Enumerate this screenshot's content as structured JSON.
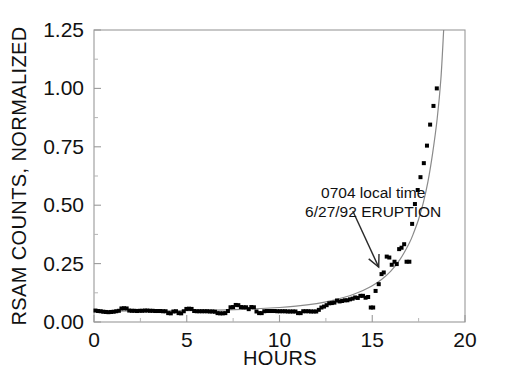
{
  "chart_data": {
    "type": "scatter",
    "title": "",
    "subtitle": "",
    "xlabel": "HOURS",
    "ylabel": "RSAM COUNTS, NORMALIZED",
    "xlim": [
      0,
      20
    ],
    "ylim": [
      0.0,
      1.25
    ],
    "xticks": [
      0,
      5,
      10,
      15,
      20
    ],
    "xtick_labels": [
      "0",
      "5",
      "10",
      "15",
      "20"
    ],
    "yticks": [
      0.0,
      0.25,
      0.5,
      0.75,
      1.0,
      1.25
    ],
    "ytick_labels": [
      "0.00",
      "0.25",
      "0.50",
      "0.75",
      "1.00",
      "1.25"
    ],
    "minor_xticks": [
      2.5,
      7.5,
      12.5,
      17.5
    ],
    "minor_yticks": [
      0.125,
      0.375,
      0.625,
      0.875,
      1.125
    ],
    "grid": false,
    "legend": null,
    "legend_position": "none",
    "marker": "square",
    "marker_color": "#000000",
    "marker_size": 4,
    "fit_curve_color": "#8a8a8a",
    "axis_color": "#9a9a9a",
    "background_color": "#ffffff",
    "series": [
      {
        "name": "RSAM counts, normalized",
        "points": [
          [
            0.08,
            0.049
          ],
          [
            0.22,
            0.047
          ],
          [
            0.36,
            0.046
          ],
          [
            0.5,
            0.044
          ],
          [
            0.64,
            0.043
          ],
          [
            0.78,
            0.042
          ],
          [
            0.92,
            0.043
          ],
          [
            1.06,
            0.044
          ],
          [
            1.2,
            0.046
          ],
          [
            1.34,
            0.048
          ],
          [
            1.48,
            0.058
          ],
          [
            1.62,
            0.059
          ],
          [
            1.76,
            0.058
          ],
          [
            1.9,
            0.049
          ],
          [
            2.04,
            0.048
          ],
          [
            2.18,
            0.048
          ],
          [
            2.32,
            0.047
          ],
          [
            2.46,
            0.048
          ],
          [
            2.6,
            0.048
          ],
          [
            2.74,
            0.049
          ],
          [
            2.88,
            0.049
          ],
          [
            3.02,
            0.048
          ],
          [
            3.16,
            0.048
          ],
          [
            3.3,
            0.047
          ],
          [
            3.44,
            0.047
          ],
          [
            3.58,
            0.047
          ],
          [
            3.72,
            0.046
          ],
          [
            3.86,
            0.046
          ],
          [
            4.0,
            0.038
          ],
          [
            4.14,
            0.037
          ],
          [
            4.28,
            0.045
          ],
          [
            4.42,
            0.046
          ],
          [
            4.56,
            0.038
          ],
          [
            4.7,
            0.037
          ],
          [
            4.84,
            0.046
          ],
          [
            4.98,
            0.056
          ],
          [
            5.12,
            0.057
          ],
          [
            5.26,
            0.056
          ],
          [
            5.4,
            0.047
          ],
          [
            5.54,
            0.046
          ],
          [
            5.68,
            0.046
          ],
          [
            5.82,
            0.046
          ],
          [
            5.96,
            0.046
          ],
          [
            6.1,
            0.046
          ],
          [
            6.24,
            0.045
          ],
          [
            6.38,
            0.045
          ],
          [
            6.52,
            0.044
          ],
          [
            6.66,
            0.038
          ],
          [
            6.8,
            0.037
          ],
          [
            6.94,
            0.037
          ],
          [
            7.08,
            0.038
          ],
          [
            7.22,
            0.047
          ],
          [
            7.36,
            0.063
          ],
          [
            7.5,
            0.064
          ],
          [
            7.64,
            0.073
          ],
          [
            7.78,
            0.072
          ],
          [
            7.92,
            0.064
          ],
          [
            8.06,
            0.063
          ],
          [
            8.2,
            0.063
          ],
          [
            8.34,
            0.055
          ],
          [
            8.48,
            0.064
          ],
          [
            8.62,
            0.063
          ],
          [
            8.76,
            0.045
          ],
          [
            8.9,
            0.038
          ],
          [
            9.04,
            0.038
          ],
          [
            9.18,
            0.046
          ],
          [
            9.32,
            0.047
          ],
          [
            9.46,
            0.047
          ],
          [
            9.6,
            0.047
          ],
          [
            9.74,
            0.047
          ],
          [
            9.88,
            0.046
          ],
          [
            10.02,
            0.046
          ],
          [
            10.16,
            0.046
          ],
          [
            10.3,
            0.046
          ],
          [
            10.44,
            0.045
          ],
          [
            10.58,
            0.045
          ],
          [
            10.72,
            0.045
          ],
          [
            10.86,
            0.045
          ],
          [
            11.0,
            0.038
          ],
          [
            11.14,
            0.038
          ],
          [
            11.28,
            0.046
          ],
          [
            11.42,
            0.046
          ],
          [
            11.56,
            0.046
          ],
          [
            11.7,
            0.045
          ],
          [
            11.84,
            0.045
          ],
          [
            11.98,
            0.045
          ],
          [
            12.12,
            0.052
          ],
          [
            12.26,
            0.062
          ],
          [
            12.4,
            0.066
          ],
          [
            12.54,
            0.072
          ],
          [
            12.68,
            0.08
          ],
          [
            12.82,
            0.081
          ],
          [
            12.96,
            0.083
          ],
          [
            13.1,
            0.092
          ],
          [
            13.24,
            0.088
          ],
          [
            13.38,
            0.09
          ],
          [
            13.52,
            0.093
          ],
          [
            13.66,
            0.093
          ],
          [
            13.8,
            0.097
          ],
          [
            13.94,
            0.1
          ],
          [
            14.08,
            0.105
          ],
          [
            14.22,
            0.103
          ],
          [
            14.36,
            0.112
          ],
          [
            14.5,
            0.112
          ],
          [
            14.64,
            0.104
          ],
          [
            14.78,
            0.107
          ],
          [
            14.92,
            0.062
          ],
          [
            15.05,
            0.062
          ],
          [
            15.18,
            0.133
          ],
          [
            15.35,
            0.162
          ],
          [
            15.5,
            0.205
          ],
          [
            15.62,
            0.212
          ],
          [
            15.78,
            0.28
          ],
          [
            15.92,
            0.276
          ],
          [
            16.05,
            0.245
          ],
          [
            16.2,
            0.258
          ],
          [
            16.32,
            0.248
          ],
          [
            16.45,
            0.312
          ],
          [
            16.58,
            0.318
          ],
          [
            16.72,
            0.333
          ],
          [
            16.85,
            0.258
          ],
          [
            17.0,
            0.258
          ],
          [
            17.15,
            0.42
          ],
          [
            17.3,
            0.505
          ],
          [
            17.45,
            0.565
          ],
          [
            17.6,
            0.62
          ],
          [
            17.78,
            0.68
          ],
          [
            17.95,
            0.755
          ],
          [
            18.12,
            0.845
          ],
          [
            18.3,
            0.925
          ],
          [
            18.48,
            1.0
          ]
        ]
      }
    ],
    "fit_curve": {
      "name": "exponential fit",
      "description": "smooth exponential envelope through the RSAM data, exits top of plot near hour 18.8",
      "points": [
        [
          0.0,
          0.046
        ],
        [
          2.0,
          0.047
        ],
        [
          4.0,
          0.048
        ],
        [
          6.0,
          0.05
        ],
        [
          8.0,
          0.054
        ],
        [
          10.0,
          0.062
        ],
        [
          11.0,
          0.069
        ],
        [
          12.0,
          0.079
        ],
        [
          12.5,
          0.086
        ],
        [
          13.0,
          0.095
        ],
        [
          13.5,
          0.106
        ],
        [
          14.0,
          0.119
        ],
        [
          14.5,
          0.135
        ],
        [
          15.0,
          0.155
        ],
        [
          15.5,
          0.182
        ],
        [
          16.0,
          0.218
        ],
        [
          16.5,
          0.268
        ],
        [
          17.0,
          0.338
        ],
        [
          17.25,
          0.385
        ],
        [
          17.5,
          0.44
        ],
        [
          17.75,
          0.51
        ],
        [
          18.0,
          0.6
        ],
        [
          18.25,
          0.72
        ],
        [
          18.5,
          0.87
        ],
        [
          18.7,
          1.04
        ],
        [
          18.85,
          1.25
        ]
      ]
    },
    "annotations": [
      {
        "id": "eruption-annotation",
        "line1": "0704 local time",
        "line2": "6/27/92 ERUPTION",
        "text_x": 15.05,
        "text_y": 0.53,
        "arrow_from": [
          13.95,
          0.475
        ],
        "arrow_to": [
          15.35,
          0.235
        ]
      }
    ]
  }
}
